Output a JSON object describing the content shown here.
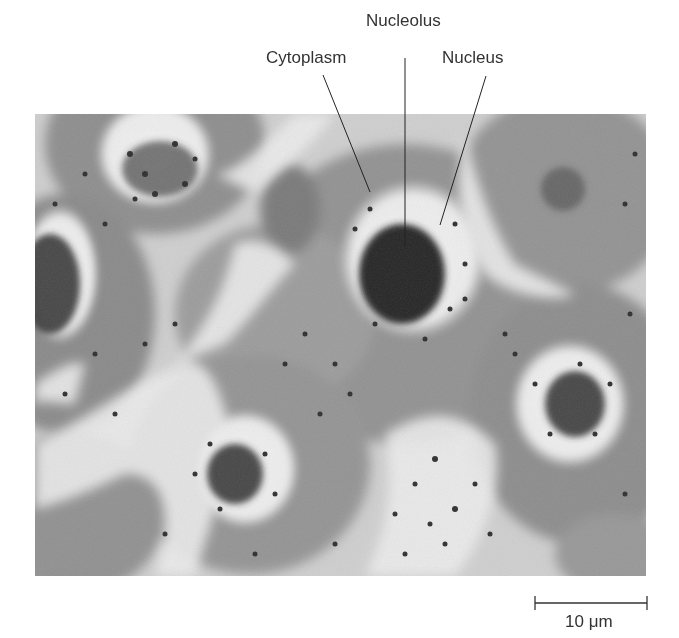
{
  "figure": {
    "type": "light micrograph of cells",
    "labels": {
      "nucleolus": "Nucleolus",
      "cytoplasm": "Cytoplasm",
      "nucleus": "Nucleus"
    },
    "scale_bar": {
      "label": "10 μm"
    }
  },
  "colors": {
    "background": "#ffffff",
    "cytoplasm_gray": "#8f8f8f",
    "light_region": "#ececec",
    "nucleolus_dark": "#2a2a2a",
    "label_text": "#333333"
  }
}
